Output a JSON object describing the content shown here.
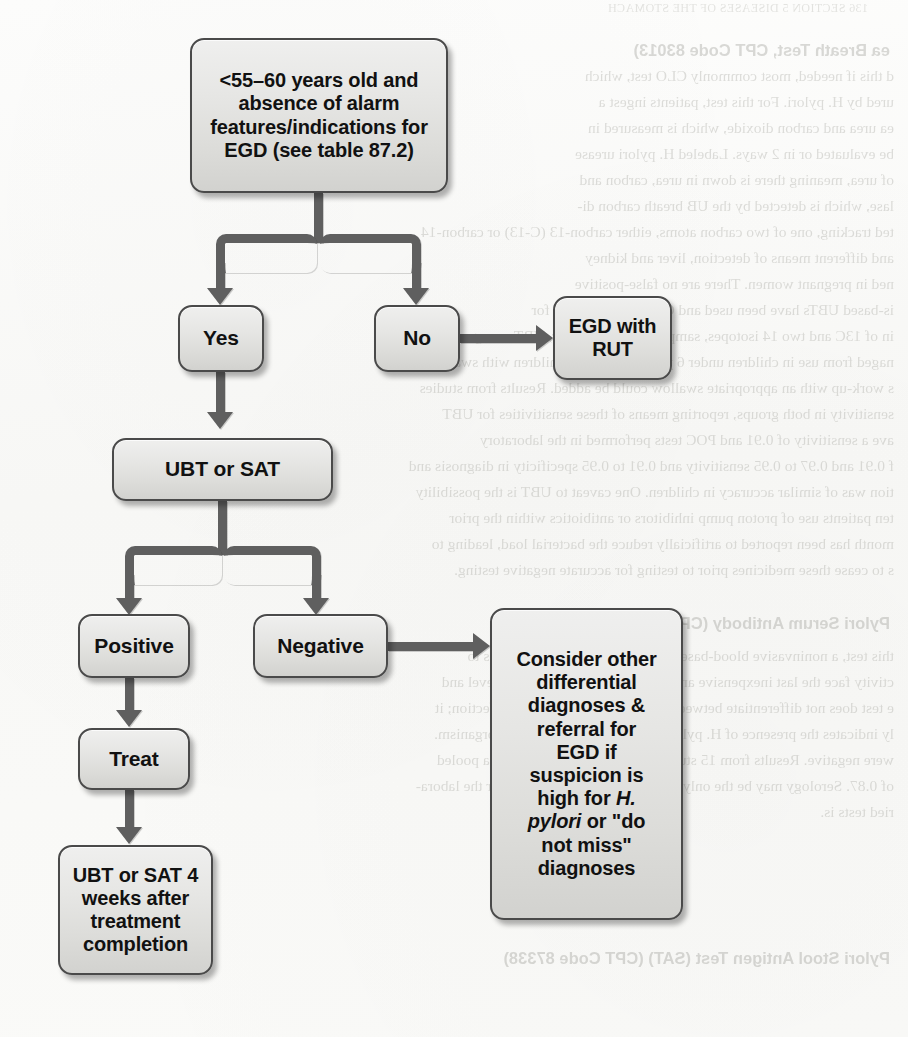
{
  "page": {
    "kind": "scanned-textbook-flowchart",
    "width": 908,
    "height": 1037,
    "ink_color": "#4a4a4a",
    "node_fill": "#e4e4e1",
    "connector_color": "#5f5f5f",
    "text_color": "#111111"
  },
  "flowchart": {
    "title": "H. pylori testing algorithm",
    "nodes": [
      {
        "id": "criteria",
        "name": "node-age-criteria",
        "lines": [
          "<55–60 years old and",
          "absence of alarm",
          "features/indications for",
          "EGD (see table 87.2)"
        ],
        "text": "<55–60 years old and absence of alarm features/indications for EGD (see table 87.2)",
        "x": 190,
        "y": 38,
        "w": 258,
        "h": 155,
        "fontSize": 20
      },
      {
        "id": "yes",
        "name": "node-yes",
        "lines": [
          "Yes"
        ],
        "text": "Yes",
        "x": 178,
        "y": 305,
        "w": 86,
        "h": 67,
        "fontSize": 21
      },
      {
        "id": "no",
        "name": "node-no",
        "lines": [
          "No"
        ],
        "text": "No",
        "x": 374,
        "y": 305,
        "w": 86,
        "h": 67,
        "fontSize": 21
      },
      {
        "id": "egd-rut",
        "name": "node-egd-with-rut",
        "lines": [
          "EGD with",
          "RUT"
        ],
        "text": "EGD with RUT",
        "x": 553,
        "y": 296,
        "w": 119,
        "h": 84,
        "fontSize": 20
      },
      {
        "id": "ubt-sat",
        "name": "node-ubt-or-sat",
        "lines": [
          "UBT or SAT"
        ],
        "text": "UBT or SAT",
        "x": 112,
        "y": 438,
        "w": 221,
        "h": 63,
        "fontSize": 21
      },
      {
        "id": "positive",
        "name": "node-positive",
        "lines": [
          "Positive"
        ],
        "text": "Positive",
        "x": 78,
        "y": 614,
        "w": 112,
        "h": 64,
        "fontSize": 21
      },
      {
        "id": "negative",
        "name": "node-negative",
        "lines": [
          "Negative"
        ],
        "text": "Negative",
        "x": 253,
        "y": 614,
        "w": 135,
        "h": 64,
        "fontSize": 21
      },
      {
        "id": "treat",
        "name": "node-treat",
        "lines": [
          "Treat"
        ],
        "text": "Treat",
        "x": 78,
        "y": 728,
        "w": 112,
        "h": 62,
        "fontSize": 21
      },
      {
        "id": "retest",
        "name": "node-retest-after-treatment",
        "lines": [
          "UBT or SAT 4",
          "weeks after",
          "treatment",
          "completion"
        ],
        "text": "UBT or SAT 4 weeks after treatment completion",
        "x": 58,
        "y": 845,
        "w": 155,
        "h": 130,
        "fontSize": 20
      },
      {
        "id": "consider",
        "name": "node-consider-other-diagnoses",
        "lines": [
          "Consider other",
          "differential",
          "diagnoses &",
          "referral for",
          "EGD if",
          "suspicion is",
          "high for ",
          "H.",
          " ",
          "pylori",
          " or \"do",
          "not miss\"",
          "diagnoses"
        ],
        "text": "Consider other differential diagnoses & referral for EGD if suspicion is high for H. pylori or \"do not miss\" diagnoses",
        "text_plain_1": "Consider other",
        "text_plain_2": "differential",
        "text_plain_3": "diagnoses &",
        "text_plain_4": "referral for",
        "text_plain_5": "EGD if",
        "text_plain_6": "suspicion is",
        "text_plain_7a": "high for ",
        "text_ital_7b": "H.",
        "text_ital_8a": "pylori",
        "text_plain_8b": " or \"do",
        "text_plain_9": "not miss\"",
        "text_plain_10": "diagnoses",
        "x": 490,
        "y": 608,
        "w": 193,
        "h": 312,
        "fontSize": 20
      }
    ],
    "edges": [
      {
        "id": "e1",
        "name": "edge-criteria-to-split",
        "from": "criteria",
        "to": "split-yes-no"
      },
      {
        "id": "e2",
        "name": "edge-split-to-yes",
        "from": "split",
        "to": "yes",
        "arrow": "down"
      },
      {
        "id": "e3",
        "name": "edge-split-to-no",
        "from": "split",
        "to": "no",
        "arrow": "down"
      },
      {
        "id": "e4",
        "name": "edge-no-to-egd-rut",
        "from": "no",
        "to": "egd-rut",
        "arrow": "right"
      },
      {
        "id": "e5",
        "name": "edge-yes-to-ubt-sat",
        "from": "yes",
        "to": "ubt-sat",
        "arrow": "down"
      },
      {
        "id": "e6",
        "name": "edge-ubt-sat-to-positive",
        "from": "ubt-sat",
        "to": "positive",
        "arrow": "down"
      },
      {
        "id": "e7",
        "name": "edge-ubt-sat-to-negative",
        "from": "ubt-sat",
        "to": "negative",
        "arrow": "down"
      },
      {
        "id": "e8",
        "name": "edge-positive-to-treat",
        "from": "positive",
        "to": "treat",
        "arrow": "down"
      },
      {
        "id": "e9",
        "name": "edge-treat-to-retest",
        "from": "treat",
        "to": "retest",
        "arrow": "down"
      },
      {
        "id": "e10",
        "name": "edge-negative-to-consider",
        "from": "negative",
        "to": "consider",
        "arrow": "right"
      }
    ]
  },
  "bleed_through": {
    "note": "mirrored show-through text from the reverse page of the scan",
    "lines": [
      {
        "text": "136    SECTION 5  DISEASES OF THE STOMACH",
        "x": 40,
        "y": 2,
        "cls": "bl tiny"
      },
      {
        "text": "ea Breath Test, CPT Code 83013)",
        "x": 18,
        "y": 42,
        "cls": "bl hdr"
      },
      {
        "text": "d this if needed, most commonly CLO test, which",
        "x": 14,
        "y": 68,
        "cls": "bl"
      },
      {
        "text": "ured by H. pylori. For this test, patients ingest a",
        "x": 14,
        "y": 94,
        "cls": "bl"
      },
      {
        "text": "ea urea and carbon dioxide, which is measured in",
        "x": 14,
        "y": 120,
        "cls": "bl"
      },
      {
        "text": "be evaluated or in 2 ways. Labeled H. pylori urease",
        "x": 14,
        "y": 146,
        "cls": "bl"
      },
      {
        "text": "of urea, meaning there is down in urea, carbon and",
        "x": 14,
        "y": 172,
        "cls": "bl"
      },
      {
        "text": "lase, which is detected by the UB breath carbon di-",
        "x": 14,
        "y": 198,
        "cls": "bl"
      },
      {
        "text": "ted tracking, one of two carbon atoms, either carbon-13 (C-13) or carbon-14",
        "x": 14,
        "y": 224,
        "cls": "bl"
      },
      {
        "text": "and different means of detection, liver and kidney",
        "x": 14,
        "y": 250,
        "cls": "bl"
      },
      {
        "text": "ned in pregnant women. There are no false-positive",
        "x": 14,
        "y": 276,
        "cls": "bl"
      },
      {
        "text": "is-based UBTs have been used and CPT tests approved for",
        "x": 14,
        "y": 302,
        "cls": "bl"
      },
      {
        "text": "in of 13C and two 14 isotopes, sample UBTs. However, UBTs are generally dis-",
        "x": 14,
        "y": 328,
        "cls": "bl"
      },
      {
        "text": "naged from use in children under 6 years of age, and children with swal-",
        "x": 14,
        "y": 354,
        "cls": "bl"
      },
      {
        "text": "s work-up with an appropriate swallow could be added. Results from studies",
        "x": 14,
        "y": 380,
        "cls": "bl"
      },
      {
        "text": "sensitivity in both groups, reporting means of these sensitivities for UBT",
        "x": 14,
        "y": 406,
        "cls": "bl"
      },
      {
        "text": "ave a sensitivity of 0.91 and POC tests performed in the laboratory",
        "x": 14,
        "y": 432,
        "cls": "bl"
      },
      {
        "text": "f 0.91 and 0.97 to 0.95 sensitivity and 0.91 to 0.95 specificity in diagnosis and",
        "x": 14,
        "y": 458,
        "cls": "bl"
      },
      {
        "text": "tion was of similar accuracy in children. One caveat to UBT is the possibility",
        "x": 14,
        "y": 484,
        "cls": "bl"
      },
      {
        "text": "ten patients use of proton pump inhibitors or antibiotics within the prior",
        "x": 14,
        "y": 510,
        "cls": "bl"
      },
      {
        "text": "month has been reported to artificially reduce the bacterial load, leading to",
        "x": 14,
        "y": 536,
        "cls": "bl"
      },
      {
        "text": "s to cease these medicines prior to testing for accurate negative testing.",
        "x": 14,
        "y": 562,
        "cls": "bl"
      },
      {
        "text": "Pylori Serum Antibody (CPT Code 86677)",
        "x": 18,
        "y": 615,
        "cls": "bl hdr"
      },
      {
        "text": "this test, a noninvasive blood-based test for presence of antibodies to",
        "x": 14,
        "y": 648,
        "cls": "bl"
      },
      {
        "text": "ctivity face the last inexpensive and is reimbursable per plasma level and",
        "x": 14,
        "y": 674,
        "cls": "bl"
      },
      {
        "text": "e test does not differentiate between active infection and prior infection; it",
        "x": 14,
        "y": 700,
        "cls": "bl"
      },
      {
        "text": "ly indicates the presence of H. pylori antibodies to the H. pylori organism.",
        "x": 14,
        "y": 726,
        "cls": "bl"
      },
      {
        "text": "were negative. Results from 15 studies indicated (0.20 reflecting a pooled",
        "x": 14,
        "y": 752,
        "cls": "bl"
      },
      {
        "text": "of 0.87. Serology may be the only test in the USA varied POC for the labora-",
        "x": 14,
        "y": 778,
        "cls": "bl"
      },
      {
        "text": "ried tests is.",
        "x": 14,
        "y": 804,
        "cls": "bl"
      },
      {
        "text": "Pylori Stool Antigen Test (SAT) (CPT Code 87338)",
        "x": 18,
        "y": 950,
        "cls": "bl hdr"
      }
    ]
  }
}
